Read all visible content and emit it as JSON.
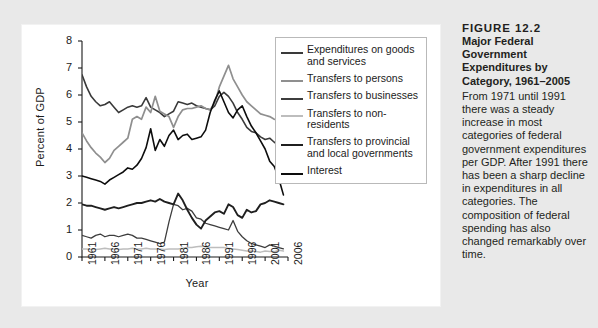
{
  "caption": {
    "figure_number": "FIGURE 12.2",
    "title": "Major Federal Government Expenditures by Category, 1961–2005",
    "body": "From 1971 until 1991 there was a steady increase in most categories of federal government expenditures per GDP. After 1991 there has been a sharp decline in expenditures in all categories. The composition of federal spending has also changed remarkably over time."
  },
  "chart_data": {
    "type": "line",
    "title": "",
    "xlabel": "Year",
    "ylabel": "Percent of GDP",
    "xlim": [
      1961,
      2006
    ],
    "ylim": [
      0,
      8
    ],
    "yticks": [
      0,
      1,
      2,
      3,
      4,
      5,
      6,
      7,
      8
    ],
    "xticks": [
      1961,
      1966,
      1971,
      1976,
      1981,
      1986,
      1991,
      1996,
      2001,
      2006
    ],
    "grid": false,
    "legend_position": "inside-right",
    "x": [
      1961,
      1962,
      1963,
      1964,
      1965,
      1966,
      1967,
      1968,
      1969,
      1970,
      1971,
      1972,
      1973,
      1974,
      1975,
      1976,
      1977,
      1978,
      1979,
      1980,
      1981,
      1982,
      1983,
      1984,
      1985,
      1986,
      1987,
      1988,
      1989,
      1990,
      1991,
      1992,
      1993,
      1994,
      1995,
      1996,
      1997,
      1998,
      1999,
      2000,
      2001,
      2002,
      2003,
      2004,
      2005
    ],
    "series": [
      {
        "name": "Expenditures on goods and services",
        "color": "#3a3a3a",
        "width": 1.6,
        "values": [
          6.75,
          6.3,
          5.95,
          5.75,
          5.6,
          5.65,
          5.75,
          5.55,
          5.35,
          5.45,
          5.55,
          5.6,
          5.55,
          5.6,
          5.9,
          5.55,
          5.45,
          5.35,
          5.2,
          5.3,
          5.4,
          5.75,
          5.7,
          5.65,
          5.7,
          5.6,
          5.55,
          5.5,
          5.45,
          5.6,
          5.95,
          6.1,
          5.95,
          5.7,
          5.35,
          5.1,
          4.8,
          4.65,
          4.6,
          4.45,
          4.35,
          4.4,
          4.25,
          4.15,
          4.05
        ]
      },
      {
        "name": "Transfers to persons",
        "color": "#8f8f8f",
        "width": 1.7,
        "values": [
          4.6,
          4.3,
          4.05,
          3.85,
          3.7,
          3.5,
          3.65,
          3.95,
          4.1,
          4.25,
          4.4,
          5.1,
          5.2,
          5.1,
          5.55,
          5.35,
          5.95,
          5.4,
          5.3,
          5.2,
          4.8,
          5.2,
          5.45,
          5.5,
          5.5,
          5.55,
          5.6,
          5.5,
          5.45,
          5.7,
          6.3,
          6.7,
          7.1,
          6.6,
          6.3,
          6.0,
          5.75,
          5.6,
          5.45,
          5.3,
          5.25,
          5.2,
          5.1,
          5.05,
          4.9
        ]
      },
      {
        "name": "Transfers to businesses",
        "color": "#3d3d3d",
        "width": 1.3,
        "values": [
          0.8,
          0.75,
          0.7,
          0.8,
          0.85,
          0.75,
          0.8,
          0.8,
          0.75,
          0.8,
          0.85,
          0.8,
          0.7,
          0.7,
          0.65,
          0.6,
          0.55,
          0.5,
          0.55,
          1.3,
          1.95,
          1.9,
          1.75,
          1.8,
          1.7,
          1.45,
          1.4,
          1.25,
          1.2,
          1.15,
          1.1,
          1.05,
          1.0,
          1.35,
          0.95,
          0.75,
          0.6,
          0.5,
          0.45,
          0.4,
          0.35,
          0.45,
          0.4,
          0.35,
          0.3
        ]
      },
      {
        "name": "Transfers to non-residents",
        "color": "#bdbdbd",
        "width": 1.5,
        "values": [
          0.3,
          0.3,
          0.28,
          0.28,
          0.3,
          0.32,
          0.3,
          0.3,
          0.28,
          0.3,
          0.3,
          0.32,
          0.3,
          0.3,
          0.32,
          0.3,
          0.3,
          0.3,
          0.28,
          0.3,
          0.3,
          0.3,
          0.32,
          0.35,
          0.35,
          0.38,
          0.4,
          0.38,
          0.35,
          0.35,
          0.35,
          0.35,
          0.32,
          0.3,
          0.28,
          0.25,
          0.22,
          0.22,
          0.2,
          0.18,
          0.22,
          0.2,
          0.2,
          0.25,
          0.22
        ]
      },
      {
        "name": "Transfers to provincial and local governments",
        "color": "#1f1f1f",
        "width": 1.9,
        "values": [
          1.95,
          1.9,
          1.9,
          1.85,
          1.8,
          1.75,
          1.8,
          1.85,
          1.8,
          1.85,
          1.9,
          1.95,
          2.0,
          2.0,
          2.05,
          2.1,
          2.05,
          2.15,
          2.05,
          2.0,
          1.95,
          2.35,
          2.1,
          1.75,
          1.45,
          1.2,
          1.05,
          1.35,
          1.5,
          1.65,
          1.7,
          1.6,
          1.95,
          1.85,
          1.55,
          1.45,
          1.75,
          1.65,
          1.7,
          1.95,
          2.0,
          2.1,
          2.05,
          2.0,
          1.95
        ]
      },
      {
        "name": "Interest",
        "color": "#0d0d0d",
        "width": 1.6,
        "values": [
          3.0,
          2.95,
          2.9,
          2.85,
          2.8,
          2.7,
          2.85,
          2.95,
          3.05,
          3.15,
          3.3,
          3.25,
          3.4,
          3.65,
          4.05,
          4.75,
          3.95,
          4.35,
          4.1,
          4.5,
          4.7,
          4.35,
          4.5,
          4.55,
          4.35,
          4.4,
          4.45,
          4.7,
          5.35,
          5.8,
          6.15,
          5.75,
          5.35,
          5.15,
          5.45,
          5.6,
          5.2,
          4.85,
          4.6,
          4.3,
          4.0,
          3.55,
          3.35,
          2.9,
          2.3
        ]
      }
    ]
  },
  "legend": {
    "items": [
      {
        "label": "Expenditures on goods and services",
        "color": "#3a3a3a",
        "width": 2
      },
      {
        "label": "Transfers to persons",
        "color": "#8f8f8f",
        "width": 2
      },
      {
        "label": "Transfers to businesses",
        "color": "#3d3d3d",
        "width": 2
      },
      {
        "label": "Transfers to non-residents",
        "color": "#bdbdbd",
        "width": 2
      },
      {
        "label": "Transfers to provincial and local governments",
        "color": "#1f1f1f",
        "width": 2.5
      },
      {
        "label": "Interest",
        "color": "#0d0d0d",
        "width": 2.5
      }
    ]
  },
  "colors": {
    "page_background": "#e9e9e9",
    "panel_background": "#ffffff",
    "axis": "#1b1b1b",
    "legend_border": "#b9b9b9",
    "text": "#231f20"
  }
}
